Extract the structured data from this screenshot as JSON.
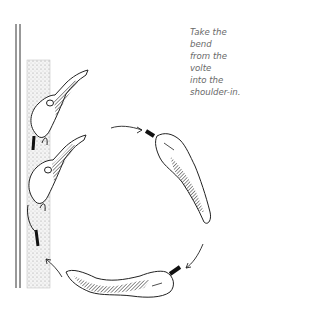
{
  "caption": {
    "lines": [
      "Take the bend",
      "from the volte",
      "into the",
      "shoulder-in."
    ]
  },
  "figure": {
    "horses": [
      {
        "id": "horse-wall-upper",
        "description": "horse in shoulder-in along wall"
      },
      {
        "id": "horse-wall-lower",
        "description": "horse in shoulder-in along wall"
      },
      {
        "id": "horse-circle-right",
        "description": "horse on volte, right side"
      },
      {
        "id": "horse-circle-bottom",
        "description": "horse on volte, bottom"
      }
    ],
    "arrows": [
      "arrow-top",
      "arrow-right",
      "arrow-left"
    ],
    "colors": {
      "ink": "#1a1a1a",
      "stipple": "#bdbdbd"
    }
  }
}
